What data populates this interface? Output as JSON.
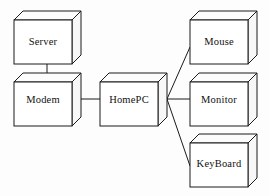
{
  "diagram": {
    "type": "block-diagram",
    "background_color": "#fdfdfd",
    "line_color": "#1a1a1a",
    "nodes": [
      {
        "id": "server",
        "label": "Server",
        "shape": "3d-box",
        "x": 14,
        "y": 20,
        "width": 58,
        "height": 44,
        "depth": 9,
        "label_x": 43,
        "label_y": 43
      },
      {
        "id": "modem",
        "label": "Modem",
        "shape": "3d-box",
        "x": 14,
        "y": 82,
        "width": 58,
        "height": 44,
        "depth": 9,
        "label_x": 43,
        "label_y": 101
      },
      {
        "id": "homepc",
        "label": "HomePC",
        "shape": "3d-box",
        "x": 100,
        "y": 82,
        "width": 58,
        "height": 44,
        "depth": 9,
        "label_x": 129,
        "label_y": 101
      },
      {
        "id": "mouse",
        "label": "Mouse",
        "shape": "3d-box",
        "x": 190,
        "y": 20,
        "width": 58,
        "height": 44,
        "depth": 9,
        "label_x": 219,
        "label_y": 43
      },
      {
        "id": "monitor",
        "label": "Monitor",
        "shape": "3d-box",
        "x": 190,
        "y": 82,
        "width": 58,
        "height": 44,
        "depth": 9,
        "label_x": 219,
        "label_y": 101
      },
      {
        "id": "keyboard",
        "label": "KeyBoard",
        "shape": "3d-box",
        "x": 190,
        "y": 143,
        "width": 58,
        "height": 44,
        "depth": 9,
        "label_x": 219,
        "label_y": 165
      }
    ],
    "connections": [
      {
        "id": "server-modem",
        "from": "server",
        "to": "modem",
        "points": "47,64 47,82"
      },
      {
        "id": "modem-homepc",
        "from": "modem",
        "to": "homepc",
        "points": "72,99 100,99"
      },
      {
        "id": "homepc-mouse",
        "from": "homepc",
        "to": "mouse",
        "points": "167,99 190,47"
      },
      {
        "id": "homepc-monitor",
        "from": "homepc",
        "to": "monitor",
        "points": "167,99 190,99"
      },
      {
        "id": "homepc-keyboard",
        "from": "homepc",
        "to": "keyboard",
        "points": "167,99 190,166"
      }
    ]
  }
}
